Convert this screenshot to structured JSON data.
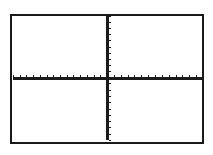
{
  "calculator_graph": {
    "window": {
      "xmin": -14,
      "xmax": 14,
      "xscl": 1,
      "ymin": -10,
      "ymax": 10,
      "yscl": 1
    },
    "axes_color": "#1a1a1a",
    "background_color": "#ffffff",
    "x_ticks_left": 14,
    "x_ticks_right": 14,
    "y_ticks_up": 10,
    "y_ticks_down": 10
  }
}
